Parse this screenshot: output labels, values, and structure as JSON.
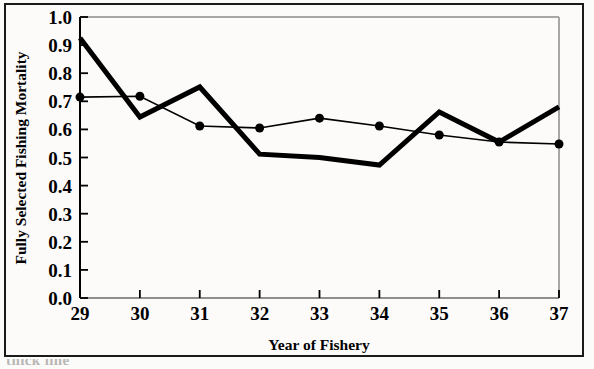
{
  "figure": {
    "background_color": "#fbfbfa",
    "frame_color": "#1a1a1a",
    "ink_color": "#000000",
    "gridline_color": "#9a9a9a"
  },
  "axis": {
    "ylabel": "Fully Selected Fishing Mortality",
    "xlabel": "Year of Fishery",
    "ytick_labels": [
      "0.0",
      "0.1",
      "0.2",
      "0.3",
      "0.4",
      "0.5",
      "0.6",
      "0.7",
      "0.8",
      "0.9",
      "1.0"
    ],
    "xtick_labels": [
      "29",
      "30",
      "31",
      "32",
      "33",
      "34",
      "35",
      "36",
      "37"
    ]
  },
  "caption": {
    "partial_text": "thick line"
  },
  "chart_data": {
    "type": "line",
    "title": "",
    "subtitle": "",
    "xlabel": "Year of Fishery",
    "ylabel": "Fully Selected Fishing Mortality",
    "x": [
      29,
      30,
      31,
      32,
      33,
      34,
      35,
      36,
      37
    ],
    "xlim": [
      29,
      37
    ],
    "ylim": [
      0.0,
      1.0
    ],
    "ytick_values": [
      0.0,
      0.1,
      0.2,
      0.3,
      0.4,
      0.5,
      0.6,
      0.7,
      0.8,
      0.9,
      1.0
    ],
    "grid": false,
    "legend_position": "none",
    "series": [
      {
        "name": "thick-line",
        "style": "thick-solid-no-marker",
        "linewidth": 5,
        "color": "#000000",
        "marker": "none",
        "values": [
          0.925,
          0.644,
          0.751,
          0.512,
          0.5,
          0.473,
          0.662,
          0.555,
          0.68
        ]
      },
      {
        "name": "thin-line-with-circles",
        "style": "thin-solid-filled-circle",
        "linewidth": 1.6,
        "color": "#000000",
        "marker": "filled-circle",
        "marker_size": 9,
        "values": [
          0.715,
          0.718,
          0.612,
          0.605,
          0.64,
          0.612,
          0.58,
          0.555,
          0.548
        ]
      }
    ]
  }
}
